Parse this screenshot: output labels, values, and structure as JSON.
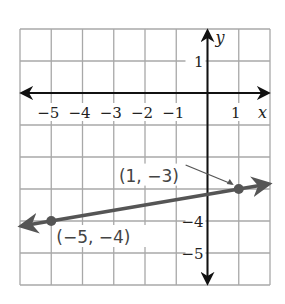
{
  "chart_data": {
    "type": "line",
    "title": "",
    "xlabel": "x",
    "ylabel": "y",
    "xlim": [
      -6,
      2
    ],
    "ylim": [
      -6,
      2
    ],
    "grid": true,
    "x_tick_labels": [
      "−5",
      "−4",
      "−3",
      "−2",
      "−1",
      "1"
    ],
    "x_tick_values": [
      -5,
      -4,
      -3,
      -2,
      -1,
      1
    ],
    "y_tick_labels": [
      "1",
      "−4",
      "−5"
    ],
    "y_tick_values": [
      1,
      -4,
      -5
    ],
    "series": [
      {
        "name": "line through points",
        "points": [
          {
            "x": -5,
            "y": -4,
            "label": "(−5, −4)"
          },
          {
            "x": 1,
            "y": -3,
            "label": "(1, −3)"
          }
        ]
      }
    ],
    "colors": {
      "grid": "#a8a8a8",
      "axis": "#111111",
      "line": "#555555",
      "point": "#555555"
    }
  }
}
